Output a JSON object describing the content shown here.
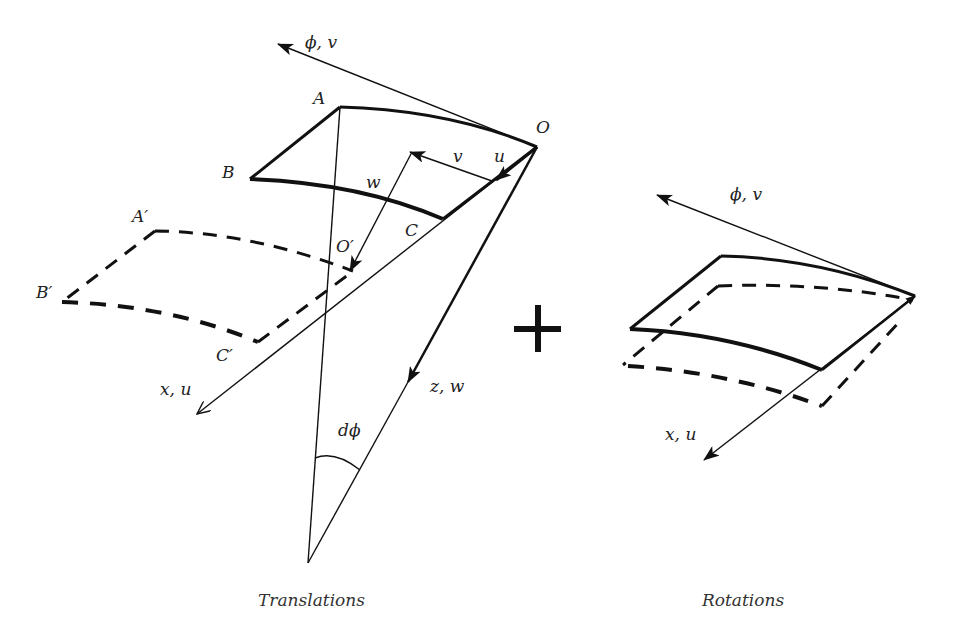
{
  "figure": {
    "panels": [
      {
        "id": "translations",
        "caption": "Translations",
        "labels": {
          "phi_v": "ϕ, v",
          "A": "A",
          "O": "O",
          "B": "B",
          "C": "C",
          "v": "v",
          "u": "u",
          "w": "w",
          "A_prime": "A′",
          "B_prime": "B′",
          "C_prime": "C′",
          "O_prime": "O′",
          "x_u": "x, u",
          "z_w": "z, w",
          "d_phi": "dϕ"
        }
      },
      {
        "id": "rotations",
        "caption": "Rotations",
        "labels": {
          "phi_v": "ϕ, v",
          "x_u": "x, u"
        }
      }
    ],
    "operator": "+",
    "colors": {
      "stroke": "#111111",
      "background": "#ffffff"
    }
  }
}
